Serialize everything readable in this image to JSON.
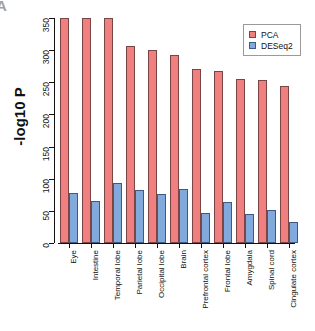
{
  "panel": {
    "letter": "A"
  },
  "chart_data": {
    "type": "bar",
    "title": "",
    "xlabel": "",
    "ylabel": "-log10 P",
    "ylim": [
      0,
      350
    ],
    "yticks": [
      0,
      50,
      100,
      150,
      200,
      250,
      300,
      350
    ],
    "ytick_labels": [
      "0",
      "50",
      "100",
      "150",
      "200",
      "250",
      "300",
      "350"
    ],
    "grid": false,
    "legend_position": "top-right",
    "categories": [
      "Eye",
      "Intestine",
      "Temporal lobe",
      "Parietal lobe",
      "Occipital lobe",
      "Brain",
      "Prefrontal cortex",
      "Frontal lobe",
      "Amygdala",
      "Spinal cord",
      "Cingulate cortex"
    ],
    "series": [
      {
        "name": "PCA",
        "color": "#f08080",
        "values": [
          350,
          350,
          350,
          306,
          301,
          292,
          271,
          267,
          255,
          253,
          244
        ]
      },
      {
        "name": "DESeq2",
        "color": "#81a9dc",
        "values": [
          78,
          65,
          94,
          83,
          77,
          84,
          47,
          64,
          45,
          52,
          33
        ]
      }
    ]
  },
  "legend": {
    "entries": [
      {
        "label": "PCA"
      },
      {
        "label": "DESeq2"
      }
    ]
  }
}
